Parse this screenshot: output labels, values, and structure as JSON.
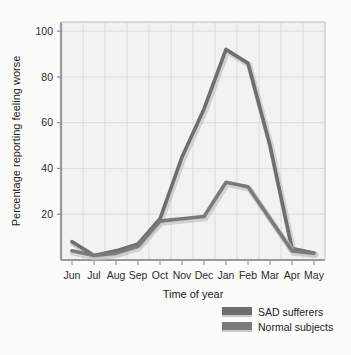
{
  "chart_data": {
    "type": "line",
    "title": "",
    "xlabel": "Time of year",
    "ylabel": "Percentage reporting feeling worse",
    "categories": [
      "Jun",
      "Jul",
      "Aug",
      "Sep",
      "Oct",
      "Nov",
      "Dec",
      "Jan",
      "Feb",
      "Mar",
      "Apr",
      "May"
    ],
    "x": [
      "Jun",
      "Jul",
      "Aug",
      "Sep",
      "Oct",
      "Nov",
      "Dec",
      "Jan",
      "Feb",
      "Mar",
      "Apr",
      "May"
    ],
    "series": [
      {
        "name": "SAD sufferers",
        "color": "#6e6e6e",
        "values": [
          8,
          2,
          4,
          7,
          18,
          45,
          66,
          92,
          86,
          50,
          5,
          3
        ]
      },
      {
        "name": "Normal subjects",
        "color": "#7a7a7a",
        "values": [
          4,
          2,
          3,
          6,
          17,
          18,
          19,
          34,
          32,
          18,
          4,
          3
        ]
      }
    ],
    "ylim": [
      0,
      104
    ],
    "yticks": [
      20,
      40,
      60,
      80,
      100
    ],
    "ytick_labels": [
      "20",
      "40",
      "60",
      "80",
      "100"
    ],
    "xtick_labels": [
      "Jun",
      "Jul",
      "Aug",
      "Sep",
      "Oct",
      "Nov",
      "Dec",
      "Jan",
      "Feb",
      "Mar",
      "Apr",
      "May"
    ],
    "grid": true,
    "legend_position": "bottom-right",
    "plot_background": "#f2f2f1",
    "grid_color": "#dcdcdc",
    "axis_color": "#a8a8a8"
  },
  "axes": {
    "y_title": "Percentage reporting feeling worse",
    "x_title": "Time of year"
  },
  "legend": {
    "entries": [
      {
        "label": "SAD sufferers"
      },
      {
        "label": "Normal subjects"
      }
    ]
  },
  "yticks": [
    {
      "label": "100"
    },
    {
      "label": "80"
    },
    {
      "label": "60"
    },
    {
      "label": "40"
    },
    {
      "label": "20"
    }
  ],
  "xticks": [
    {
      "label": "Jun"
    },
    {
      "label": "Jul"
    },
    {
      "label": "Aug"
    },
    {
      "label": "Sep"
    },
    {
      "label": "Oct"
    },
    {
      "label": "Nov"
    },
    {
      "label": "Dec"
    },
    {
      "label": "Jan"
    },
    {
      "label": "Feb"
    },
    {
      "label": "Mar"
    },
    {
      "label": "Apr"
    },
    {
      "label": "May"
    }
  ]
}
